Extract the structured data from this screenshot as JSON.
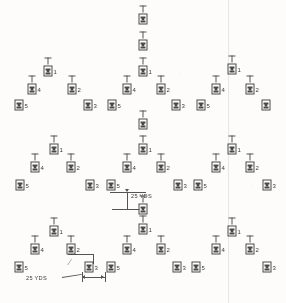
{
  "diagram": {
    "figure_icon": "soldier-figure-icon",
    "background_color": "#fbfaf8",
    "ink_color": "#4a4a4a",
    "position_numbers": [
      "1",
      "2",
      "3",
      "4",
      "5"
    ],
    "annotations": [
      {
        "id": "vertical-spacing",
        "label": "25 YDS",
        "orientation": "vertical"
      },
      {
        "id": "horizontal-spacing",
        "label": "25 YDS",
        "orientation": "horizontal"
      }
    ],
    "figures": [
      {
        "id": "f-top-c-a",
        "x": 143,
        "y": 18,
        "num": "",
        "stem": true
      },
      {
        "id": "f-top-c-b",
        "x": 143,
        "y": 44,
        "num": "",
        "stem": true
      },
      {
        "id": "f-top-c-c",
        "x": 143,
        "y": 70,
        "num": "1",
        "stem": true
      },
      {
        "id": "f-r1-l-1",
        "x": 48,
        "y": 70,
        "num": "1",
        "stem": true
      },
      {
        "id": "f-r1-l-4",
        "x": 32,
        "y": 88,
        "num": "4",
        "stem": true
      },
      {
        "id": "f-r1-l-2",
        "x": 72,
        "y": 88,
        "num": "2",
        "stem": true
      },
      {
        "id": "f-r1-l-5",
        "x": 19,
        "y": 104,
        "num": "5",
        "stem": false
      },
      {
        "id": "f-r1-l-3",
        "x": 88,
        "y": 104,
        "num": "3",
        "stem": false
      },
      {
        "id": "f-r1-c-4",
        "x": 127,
        "y": 88,
        "num": "4",
        "stem": true
      },
      {
        "id": "f-r1-c-2",
        "x": 161,
        "y": 88,
        "num": "2",
        "stem": true
      },
      {
        "id": "f-r1-c-5",
        "x": 112,
        "y": 104,
        "num": "5",
        "stem": false
      },
      {
        "id": "f-r1-c-3",
        "x": 176,
        "y": 104,
        "num": "3",
        "stem": false
      },
      {
        "id": "f-r1-r-1",
        "x": 232,
        "y": 68,
        "num": "1",
        "stem": true
      },
      {
        "id": "f-r1-r-4",
        "x": 216,
        "y": 88,
        "num": "4",
        "stem": true
      },
      {
        "id": "f-r1-r-2",
        "x": 250,
        "y": 88,
        "num": "2",
        "stem": true
      },
      {
        "id": "f-r1-r-5",
        "x": 201,
        "y": 104,
        "num": "5",
        "stem": false
      },
      {
        "id": "f-r1-r-3",
        "x": 266,
        "y": 104,
        "num": "",
        "stem": false
      },
      {
        "id": "f-r2-c-a",
        "x": 143,
        "y": 123,
        "num": "",
        "stem": true
      },
      {
        "id": "f-r2-c-1",
        "x": 143,
        "y": 148,
        "num": "1",
        "stem": true
      },
      {
        "id": "f-r2-l-1",
        "x": 54,
        "y": 148,
        "num": "1",
        "stem": true
      },
      {
        "id": "f-r2-l-4",
        "x": 35,
        "y": 166,
        "num": "4",
        "stem": true
      },
      {
        "id": "f-r2-l-2",
        "x": 71,
        "y": 166,
        "num": "2",
        "stem": true
      },
      {
        "id": "f-r2-l-5",
        "x": 20,
        "y": 184,
        "num": "5",
        "stem": false
      },
      {
        "id": "f-r2-l-3",
        "x": 90,
        "y": 184,
        "num": "3",
        "stem": false
      },
      {
        "id": "f-r2-c-4",
        "x": 127,
        "y": 166,
        "num": "4",
        "stem": true
      },
      {
        "id": "f-r2-c-2",
        "x": 161,
        "y": 166,
        "num": "2",
        "stem": true
      },
      {
        "id": "f-r2-c-5",
        "x": 111,
        "y": 184,
        "num": "5",
        "stem": false
      },
      {
        "id": "f-r2-c-3",
        "x": 178,
        "y": 184,
        "num": "3",
        "stem": false
      },
      {
        "id": "f-r2-r-1",
        "x": 232,
        "y": 148,
        "num": "1",
        "stem": true
      },
      {
        "id": "f-r2-r-4",
        "x": 216,
        "y": 166,
        "num": "4",
        "stem": true
      },
      {
        "id": "f-r2-r-2",
        "x": 250,
        "y": 166,
        "num": "2",
        "stem": true
      },
      {
        "id": "f-r2-r-5",
        "x": 198,
        "y": 184,
        "num": "5",
        "stem": false
      },
      {
        "id": "f-r2-r-3",
        "x": 267,
        "y": 184,
        "num": "3",
        "stem": false
      },
      {
        "id": "f-r3-c-1",
        "x": 143,
        "y": 208,
        "num": "",
        "stem": true
      },
      {
        "id": "f-r3-l-1",
        "x": 54,
        "y": 230,
        "num": "1",
        "stem": true
      },
      {
        "id": "f-r3-l-4",
        "x": 35,
        "y": 248,
        "num": "4",
        "stem": true
      },
      {
        "id": "f-r3-l-2",
        "x": 71,
        "y": 248,
        "num": "2",
        "stem": true
      },
      {
        "id": "f-r3-l-5",
        "x": 19,
        "y": 266,
        "num": "5",
        "stem": false
      },
      {
        "id": "f-r3-l-3",
        "x": 89,
        "y": 266,
        "num": "3",
        "stem": false
      },
      {
        "id": "f-r3-c-1b",
        "x": 143,
        "y": 228,
        "num": "1",
        "stem": true
      },
      {
        "id": "f-r3-c-4",
        "x": 127,
        "y": 248,
        "num": "4",
        "stem": true
      },
      {
        "id": "f-r3-c-2",
        "x": 161,
        "y": 248,
        "num": "2",
        "stem": true
      },
      {
        "id": "f-r3-c-5",
        "x": 111,
        "y": 266,
        "num": "5",
        "stem": false
      },
      {
        "id": "f-r3-c-3",
        "x": 177,
        "y": 266,
        "num": "3",
        "stem": false
      },
      {
        "id": "f-r3-r-1",
        "x": 232,
        "y": 230,
        "num": "1",
        "stem": true
      },
      {
        "id": "f-r3-r-4",
        "x": 216,
        "y": 248,
        "num": "4",
        "stem": true
      },
      {
        "id": "f-r3-r-2",
        "x": 250,
        "y": 248,
        "num": "2",
        "stem": true
      },
      {
        "id": "f-r3-r-5",
        "x": 196,
        "y": 266,
        "num": "5",
        "stem": false
      },
      {
        "id": "f-r3-r-3",
        "x": 267,
        "y": 266,
        "num": "3",
        "stem": false
      }
    ]
  }
}
